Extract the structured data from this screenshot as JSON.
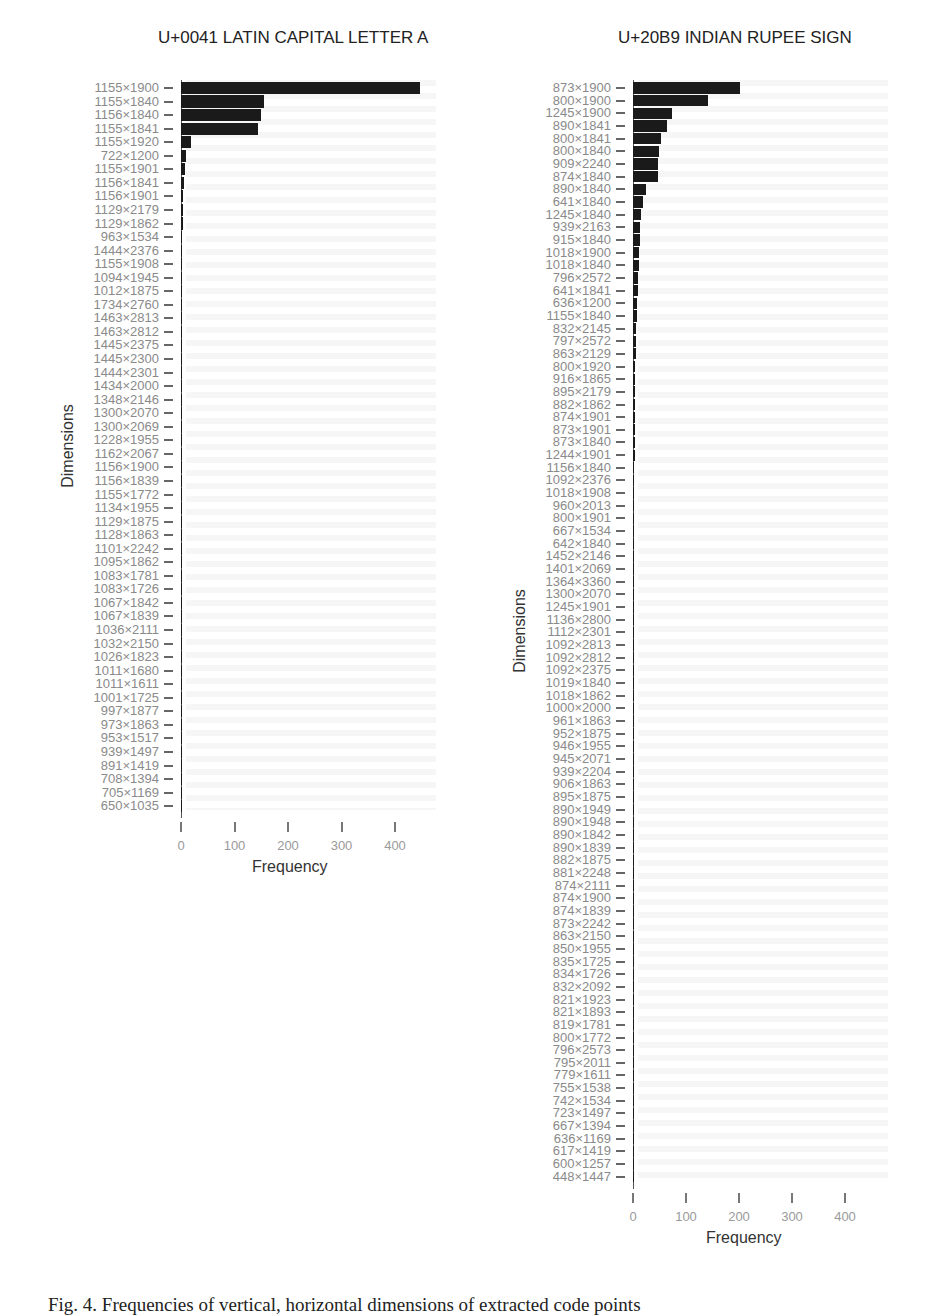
{
  "caption": "Fig. 4. Frequencies of vertical, horizontal dimensions of extracted code points",
  "chart_data": [
    {
      "type": "bar",
      "orientation": "horizontal",
      "title": "U+0041 LATIN CAPITAL LETTER A",
      "xlabel": "Frequency",
      "ylabel": "Dimensions",
      "xlim": [
        0,
        450
      ],
      "xticks": [
        0,
        100,
        200,
        300,
        400
      ],
      "grid": false,
      "categories": [
        "1155×1900",
        "1155×1840",
        "1156×1840",
        "1155×1841",
        "1155×1920",
        "722×1200",
        "1155×1901",
        "1156×1841",
        "1156×1901",
        "1129×2179",
        "1129×1862",
        "963×1534",
        "1444×2376",
        "1155×1908",
        "1094×1945",
        "1012×1875",
        "1734×2760",
        "1463×2813",
        "1463×2812",
        "1445×2375",
        "1445×2300",
        "1444×2301",
        "1434×2000",
        "1348×2146",
        "1300×2070",
        "1300×2069",
        "1228×1955",
        "1162×2067",
        "1156×1900",
        "1156×1839",
        "1155×1772",
        "1134×1955",
        "1129×1875",
        "1128×1863",
        "1101×2242",
        "1095×1862",
        "1083×1781",
        "1083×1726",
        "1067×1842",
        "1067×1839",
        "1036×2111",
        "1032×2150",
        "1026×1823",
        "1011×1680",
        "1011×1611",
        "1001×1725",
        "997×1877",
        "973×1863",
        "953×1517",
        "939×1497",
        "891×1419",
        "708×1394",
        "705×1169",
        "650×1035"
      ],
      "values": [
        447,
        156,
        149,
        143,
        18,
        9,
        7,
        6,
        4,
        3,
        3,
        2,
        2,
        2,
        2,
        2,
        1,
        1,
        1,
        1,
        1,
        1,
        1,
        1,
        1,
        1,
        1,
        1,
        1,
        1,
        1,
        1,
        1,
        1,
        1,
        1,
        1,
        1,
        1,
        1,
        1,
        1,
        1,
        1,
        1,
        1,
        1,
        1,
        1,
        1,
        1,
        1,
        1,
        1
      ]
    },
    {
      "type": "bar",
      "orientation": "horizontal",
      "title": "U+20B9 INDIAN RUPEE SIGN",
      "xlabel": "Frequency",
      "ylabel": "Dimensions",
      "xlim": [
        0,
        450
      ],
      "xticks": [
        0,
        100,
        200,
        300,
        400
      ],
      "grid": false,
      "categories": [
        "873×1900",
        "800×1900",
        "1245×1900",
        "890×1841",
        "800×1841",
        "800×1840",
        "909×2240",
        "874×1840",
        "890×1840",
        "641×1840",
        "1245×1840",
        "939×2163",
        "915×1840",
        "1018×1900",
        "1018×1840",
        "796×2572",
        "641×1841",
        "636×1200",
        "1155×1840",
        "832×2145",
        "797×2572",
        "863×2129",
        "800×1920",
        "916×1865",
        "895×2179",
        "882×1862",
        "874×1901",
        "873×1901",
        "873×1840",
        "1244×1901",
        "1156×1840",
        "1092×2376",
        "1018×1908",
        "960×2013",
        "800×1901",
        "667×1534",
        "642×1840",
        "1452×2146",
        "1401×2069",
        "1364×3360",
        "1300×2070",
        "1245×1901",
        "1136×2800",
        "1112×2301",
        "1092×2813",
        "1092×2812",
        "1092×2375",
        "1019×1840",
        "1018×1862",
        "1000×2000",
        "961×1863",
        "952×1875",
        "946×1955",
        "945×2071",
        "939×2204",
        "906×1863",
        "895×1875",
        "890×1949",
        "890×1948",
        "890×1842",
        "890×1839",
        "882×1875",
        "881×2248",
        "874×2111",
        "874×1900",
        "874×1839",
        "873×2242",
        "863×2150",
        "850×1955",
        "835×1725",
        "834×1726",
        "832×2092",
        "821×1923",
        "821×1893",
        "819×1781",
        "800×1772",
        "796×2573",
        "795×2011",
        "779×1611",
        "755×1538",
        "742×1534",
        "723×1497",
        "667×1394",
        "636×1169",
        "617×1419",
        "600×1257",
        "448×1447"
      ],
      "values": [
        202,
        141,
        74,
        64,
        53,
        49,
        47,
        47,
        25,
        18,
        16,
        14,
        13,
        12,
        11,
        10,
        9,
        8,
        7,
        6,
        5,
        5,
        4,
        4,
        3,
        3,
        3,
        3,
        3,
        3,
        2,
        2,
        2,
        2,
        2,
        2,
        2,
        1,
        1,
        1,
        1,
        1,
        1,
        1,
        1,
        1,
        1,
        1,
        1,
        1,
        1,
        1,
        1,
        1,
        1,
        1,
        1,
        1,
        1,
        1,
        1,
        1,
        1,
        1,
        1,
        1,
        1,
        1,
        1,
        1,
        1,
        1,
        1,
        1,
        1,
        1,
        1,
        1,
        1,
        1,
        1,
        1,
        1,
        1,
        1,
        1,
        1
      ]
    }
  ]
}
